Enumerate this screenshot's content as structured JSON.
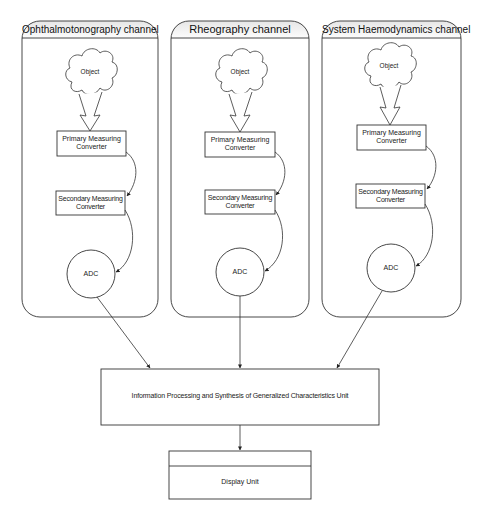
{
  "diagram": {
    "channels": [
      {
        "title": "Ophthalmotonography channel",
        "object": "Object",
        "primary": [
          "Primary Measuring",
          "Converter"
        ],
        "secondary": [
          "Secondary Measuring",
          "Converter"
        ],
        "adc": "ADC"
      },
      {
        "title": "Rheography channel",
        "object": "Object",
        "primary": [
          "Primary Measuring",
          "Converter"
        ],
        "secondary": [
          "Secondary Measuring",
          "Converter"
        ],
        "adc": "ADC"
      },
      {
        "title": "System Haemodynamics channel",
        "object": "Object",
        "primary": [
          "Primary Measuring",
          "Converter"
        ],
        "secondary": [
          "Secondary Measuring",
          "Converter"
        ],
        "adc": "ADC"
      }
    ],
    "processing_unit": "Information Processing and Synthesis of Generalized Characteristics Unit",
    "display_unit": "Display Unit",
    "colors": {
      "stroke": "#333333",
      "header_gradient_top": "#ececec",
      "header_gradient_bottom": "#ffffff",
      "background": "#ffffff"
    }
  }
}
